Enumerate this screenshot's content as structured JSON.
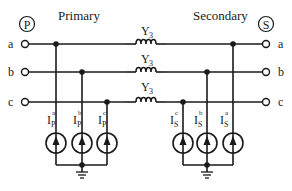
{
  "diagram": {
    "type": "three-phase circuit",
    "colors": {
      "stroke": "#1a1a1a",
      "background": "#ffffff"
    },
    "primary": {
      "title": "Primary",
      "port_symbol": "P",
      "terminals": [
        "a",
        "b",
        "c"
      ],
      "sources": [
        {
          "base": "I",
          "sub": "P",
          "sup": "a"
        },
        {
          "base": "I",
          "sub": "P",
          "sup": "b"
        },
        {
          "base": "I",
          "sub": "P",
          "sup": "c"
        }
      ]
    },
    "secondary": {
      "title": "Secondary",
      "port_symbol": "S",
      "terminals": [
        "a",
        "b",
        "c"
      ],
      "sources": [
        {
          "base": "I",
          "sub": "S",
          "sup": "c"
        },
        {
          "base": "I",
          "sub": "S",
          "sup": "b"
        },
        {
          "base": "I",
          "sub": "S",
          "sup": "a"
        }
      ]
    },
    "series_elements": [
      {
        "label_base": "Y",
        "label_sub": "3",
        "phase": "a"
      },
      {
        "label_base": "Y",
        "label_sub": "3",
        "phase": "b"
      },
      {
        "label_base": "Y",
        "label_sub": "3",
        "phase": "c"
      }
    ]
  }
}
